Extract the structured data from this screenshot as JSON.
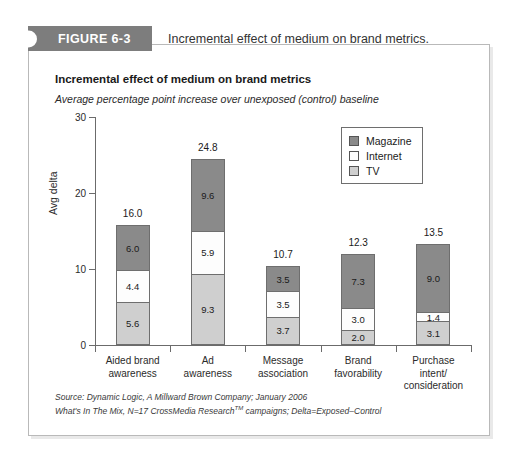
{
  "figure": {
    "badge_label": "FIGURE 6-3",
    "caption": "Incremental effect of medium on brand metrics."
  },
  "chart_header": {
    "title": "Incremental effect of medium on brand metrics",
    "subtitle": "Average percentage point increase over unexposed (control) baseline"
  },
  "legend": {
    "items": [
      {
        "label": "Magazine",
        "color": "#8a8a8a",
        "key": "magazine"
      },
      {
        "label": "Internet",
        "color": "#ffffff",
        "key": "internet"
      },
      {
        "label": "TV",
        "color": "#cfcfcf",
        "key": "tv"
      }
    ]
  },
  "source_note": {
    "line1": "Source: Dynamic Logic, A Millward Brown Company; January 2006",
    "line2_a": "What's In The Mix, N",
    "line2_b": "=",
    "line2_c": "17 CrossMedia Research",
    "line2_sup": "TM",
    "line2_d": " campaigns; Delta",
    "line2_e": "=",
    "line2_f": "Exposed",
    "line2_g": "–",
    "line2_h": "Control"
  },
  "chart_data": {
    "type": "bar",
    "stacked": true,
    "title": "Incremental effect of medium on brand metrics",
    "subtitle": "Average percentage point increase over unexposed (control) baseline",
    "xlabel": "",
    "ylabel": "Avg delta",
    "ylim": [
      0,
      30
    ],
    "yticks": [
      0,
      10,
      20,
      30
    ],
    "ytick_labels": [
      "0",
      "10",
      "20",
      "30"
    ],
    "grid": false,
    "legend_position": "top-right",
    "categories": [
      "Aided brand awareness",
      "Ad awareness",
      "Message association",
      "Brand favorability",
      "Purchase intent/consideration"
    ],
    "category_label_lines": [
      [
        "Aided brand",
        "awareness"
      ],
      [
        "Ad",
        "awareness"
      ],
      [
        "Message",
        "association"
      ],
      [
        "Brand",
        "favorability"
      ],
      [
        "Purchase",
        "intent/",
        "consideration"
      ]
    ],
    "series": [
      {
        "name": "TV",
        "color": "#cfcfcf",
        "values": [
          5.6,
          9.3,
          3.7,
          2.0,
          3.1
        ]
      },
      {
        "name": "Internet",
        "color": "#ffffff",
        "values": [
          4.4,
          5.9,
          3.5,
          3.0,
          1.4
        ]
      },
      {
        "name": "Magazine",
        "color": "#8a8a8a",
        "values": [
          6.0,
          9.6,
          3.5,
          7.3,
          9.0
        ]
      }
    ],
    "totals": [
      16.0,
      24.8,
      10.7,
      12.3,
      13.5
    ],
    "total_labels": [
      "16.0",
      "24.8",
      "10.7",
      "12.3",
      "13.5"
    ],
    "segment_labels": [
      {
        "magazine": "6.0",
        "internet": "4.4",
        "tv": "5.6"
      },
      {
        "magazine": "9.6",
        "internet": "5.9",
        "tv": "9.3"
      },
      {
        "magazine": "3.5",
        "internet": "3.5",
        "tv": "3.7"
      },
      {
        "magazine": "7.3",
        "internet": "3.0",
        "tv": "2.0"
      },
      {
        "magazine": "9.0",
        "internet": "1.4",
        "tv": "3.1"
      }
    ]
  }
}
